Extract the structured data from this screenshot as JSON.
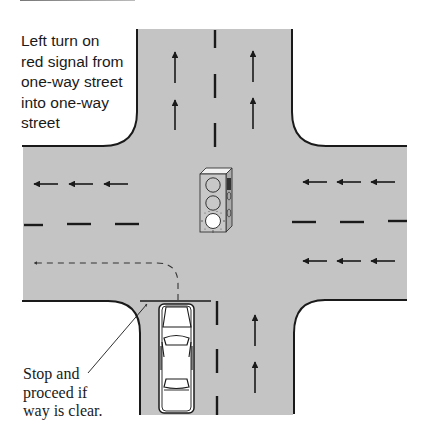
{
  "diagram": {
    "title_lines": [
      "Left turn on",
      "red signal from",
      "one-way street",
      "into one-way",
      "street"
    ],
    "callout_lines": [
      "Stop and",
      "proceed if",
      "way is clear."
    ],
    "colors": {
      "road": "#c4c4c4",
      "curb": "#1a1a1a",
      "marking": "#1a1a1a",
      "background": "#ffffff",
      "signal_lit": "#ffffff",
      "car_body": "#ffffff"
    },
    "elements": {
      "intersection": "One-way northbound street crossing one-way westbound street",
      "traffic_signal": {
        "state": "red (bottom lamp lit)",
        "lamps": 3
      },
      "northbound_arrows": 8,
      "westbound_arrows": 9,
      "turn_path": "dashed left turn from northbound stop line to westbound lanes",
      "stop_line": true,
      "car": "stopped at stop line in left northbound lane"
    }
  }
}
